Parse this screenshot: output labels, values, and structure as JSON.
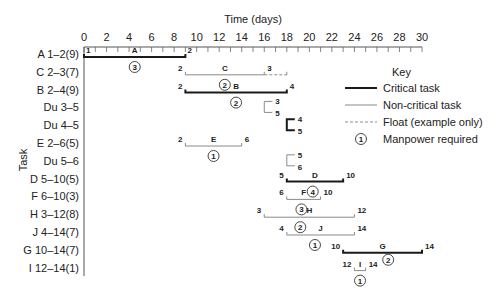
{
  "chart_data": {
    "type": "gantt",
    "title": "",
    "xlabel": "Time (days)",
    "ylabel": "Task",
    "xlim": [
      0,
      30
    ],
    "xticks": [
      0,
      2,
      4,
      6,
      8,
      10,
      12,
      14,
      16,
      18,
      20,
      22,
      24,
      26,
      28,
      30
    ],
    "grid": false,
    "legend_position": "right",
    "colors": {
      "critical": "#1a1a1a",
      "non_critical": "#8a8a8a",
      "float": "#8a8a8a",
      "text": "#222222"
    },
    "tasks": [
      {
        "label": "A 1–2(9)",
        "name": "A",
        "type": "critical",
        "start": 0,
        "end": 9,
        "start_node": "1",
        "end_node": "2",
        "manpower": 3
      },
      {
        "label": "C 2–3(7)",
        "name": "C",
        "type": "non-critical",
        "start": 9,
        "end": 16,
        "start_node": "2",
        "end_node": "3",
        "manpower": 2,
        "float_end": 18
      },
      {
        "label": "B 2–4(9)",
        "name": "B",
        "type": "critical",
        "start": 9,
        "end": 18,
        "start_node": "2",
        "end_node": "4",
        "manpower": 2
      },
      {
        "label": "Du 3–5",
        "name": "",
        "type": "dummy-non-critical",
        "start": 16,
        "end": 16,
        "start_node": "3",
        "end_node": "5"
      },
      {
        "label": "Du 4–5",
        "name": "",
        "type": "dummy-critical",
        "start": 18,
        "end": 18,
        "start_node": "4",
        "end_node": "5"
      },
      {
        "label": "E 2–6(5)",
        "name": "E",
        "type": "non-critical",
        "start": 9,
        "end": 14,
        "start_node": "2",
        "end_node": "6",
        "manpower": 1
      },
      {
        "label": "Du 5–6",
        "name": "",
        "type": "dummy-non-critical",
        "start": 18,
        "end": 18,
        "start_node": "5",
        "end_node": "6"
      },
      {
        "label": "D 5–10(5)",
        "name": "D",
        "type": "critical",
        "start": 18,
        "end": 23,
        "start_node": "5",
        "end_node": "10",
        "manpower": 4
      },
      {
        "label": "F 6–10(3)",
        "name": "F",
        "type": "non-critical",
        "start": 18,
        "end": 21,
        "start_node": "6",
        "end_node": "10",
        "manpower": 3
      },
      {
        "label": "H 3–12(8)",
        "name": "H",
        "type": "non-critical",
        "start": 16,
        "end": 24,
        "start_node": "3",
        "end_node": "12",
        "manpower": 2
      },
      {
        "label": "J 4–14(7)",
        "name": "J",
        "type": "non-critical",
        "start": 18,
        "end": 24,
        "start_node": "4",
        "end_node": "14",
        "manpower": 1
      },
      {
        "label": "G 10–14(7)",
        "name": "G",
        "type": "critical",
        "start": 23,
        "end": 30,
        "start_node": "10",
        "end_node": "14",
        "manpower": 2
      },
      {
        "label": "I 12–14(1)",
        "name": "I",
        "type": "non-critical",
        "start": 24,
        "end": 25,
        "start_node": "12",
        "end_node": "14",
        "manpower": 1
      }
    ],
    "legend": {
      "title": "Key",
      "entries": [
        {
          "label": "Critical task",
          "style": "critical"
        },
        {
          "label": "Non-critical task",
          "style": "non-critical"
        },
        {
          "label": "Float (example only)",
          "style": "float"
        },
        {
          "label": "Manpower required",
          "style": "circle",
          "symbol": "1"
        }
      ]
    }
  }
}
